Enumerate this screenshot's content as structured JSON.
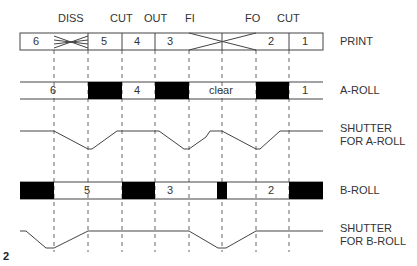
{
  "figure_number": "2",
  "top_labels": [
    {
      "text": "DISS",
      "x": 71
    },
    {
      "text": "CUT",
      "x": 122
    },
    {
      "text": "OUT",
      "x": 155
    },
    {
      "text": "FI",
      "x": 189
    },
    {
      "text": "FO",
      "x": 256
    },
    {
      "text": "CUT",
      "x": 289
    }
  ],
  "row_labels": {
    "print": "PRINT",
    "a_roll": "A-ROLL",
    "shutter_a": "SHUTTER\nFOR A-ROLL",
    "b_roll": "B-ROLL",
    "shutter_b": "SHUTTER\nFOR B-ROLL"
  },
  "print_strip": {
    "cells": [
      {
        "text": "6",
        "x": 37
      },
      {
        "text": "5",
        "x": 105
      },
      {
        "text": "4",
        "x": 138
      },
      {
        "text": "3",
        "x": 171
      },
      {
        "text": "2",
        "x": 272
      },
      {
        "text": "1",
        "x": 306
      }
    ]
  },
  "a_roll": {
    "labels": [
      {
        "text": "6",
        "x": 54
      },
      {
        "text": "4",
        "x": 138
      },
      {
        "text": "clear",
        "x": 222
      },
      {
        "text": "1",
        "x": 306
      }
    ]
  },
  "b_roll": {
    "labels": [
      {
        "text": "5",
        "x": 88
      },
      {
        "text": "3",
        "x": 171
      },
      {
        "text": "2",
        "x": 272
      }
    ]
  },
  "colors": {
    "line": "#444444",
    "dash": "#666666",
    "block": "#000000"
  }
}
